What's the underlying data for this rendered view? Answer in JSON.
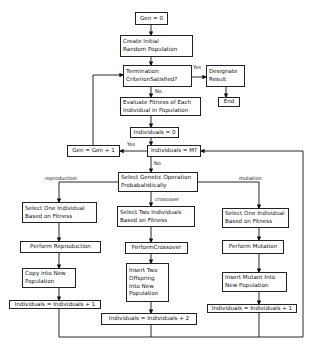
{
  "diagram": {
    "type": "flowchart",
    "nodes": {
      "gen0": "Gen = 0",
      "create": "Create Initial\nRandom Population",
      "termination": "Termination\nCriterionSatisfied?",
      "designate": "Designate\nResult",
      "end": "End",
      "evaluate": "Evaluate Fitness of Each\nIndividual  in Population",
      "ind0": "Individuals = 0",
      "genInc": "Gen = Gen + 1",
      "indM": "Individuals = M?",
      "selectOp": "Select Genetic Operation\nProbabalistically",
      "r_select": "Select One Individual\nBased on Fitness",
      "r_perform": "Perform  Reproduction",
      "r_copy": "Copy into New\nPopulation",
      "r_inc": "Individuals = Individuals + 1",
      "c_select": "Select Two Individuals\nBased on Fitness",
      "c_perform": "PerformCrossover",
      "c_insert": "Insert Two\nOffspring\nInto New\nPopulation",
      "c_inc": "Individuals = Individuals + 2",
      "m_select": "Select One Individual\nBased on Fitness",
      "m_perform": "Perform  Mutation",
      "m_insert": "Insert  Mutant Into\nNew Population",
      "m_inc": "Individuals = Individuals + 1"
    },
    "edge_labels": {
      "yes1": "Yes",
      "no1": "No",
      "yes2": "Yes",
      "no2": "No",
      "reproduction": "reproduction",
      "crossover": "crossover",
      "mutation": "mutation"
    }
  }
}
